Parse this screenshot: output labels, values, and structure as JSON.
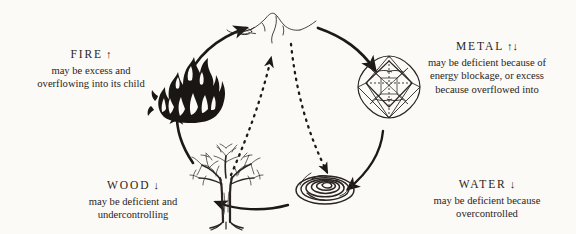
{
  "diagram": {
    "background_color": "#fbfaf7",
    "ink_color": "#221d1a",
    "cycle_direction": "clockwise",
    "elements": [
      {
        "id": "fire",
        "name": "FIRE",
        "arrows": "↑",
        "arrow_meaning": "excess",
        "description": "may be excess and\noverflowing into its child",
        "icon": "flame-icon",
        "position": "upper-left"
      },
      {
        "id": "earth",
        "name": "EARTH",
        "arrows": "",
        "arrow_meaning": "",
        "description": "",
        "icon": "mountain-icon",
        "position": "top-center"
      },
      {
        "id": "metal",
        "name": "METAL",
        "arrows": "↑↓",
        "arrow_meaning": "deficient or excess",
        "description": "may be deficient because of\nenergy blockage, or excess\nbecause overflowed into",
        "icon": "gem-icon",
        "position": "upper-right"
      },
      {
        "id": "water",
        "name": "WATER",
        "arrows": "↓",
        "arrow_meaning": "deficient",
        "description": "may be deficient because\novercontrolled",
        "icon": "ripple-icon",
        "position": "lower-right"
      },
      {
        "id": "wood",
        "name": "WOOD",
        "arrows": "↓",
        "arrow_meaning": "deficient",
        "description": "may be deficient and\nundercontrolling",
        "icon": "tree-icon",
        "position": "lower-left"
      }
    ],
    "generating_cycle": [
      {
        "from": "wood",
        "to": "fire",
        "style": "solid"
      },
      {
        "from": "fire",
        "to": "earth",
        "style": "solid"
      },
      {
        "from": "earth",
        "to": "metal",
        "style": "solid"
      },
      {
        "from": "metal",
        "to": "water",
        "style": "solid"
      },
      {
        "from": "water",
        "to": "wood",
        "style": "solid"
      }
    ],
    "controlling_cycle": [
      {
        "from": "wood",
        "to": "earth",
        "style": "dashed"
      },
      {
        "from": "metal",
        "to": "water",
        "style": "dashed"
      }
    ]
  }
}
